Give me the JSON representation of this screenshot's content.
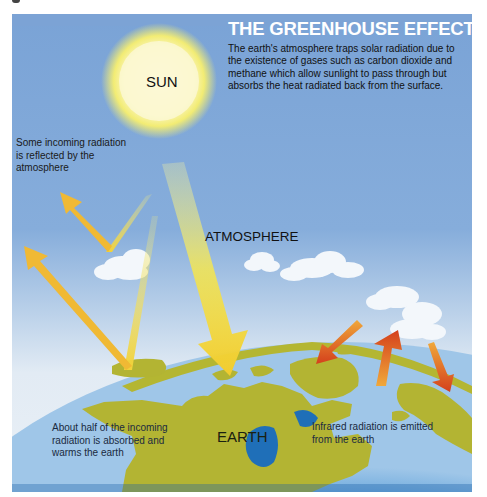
{
  "title": "THE GREENHOUSE EFFECT",
  "description": "The earth's atmosphere traps solar radiation due to the existence of gases such as carbon dioxide and methane which allow sunlight to pass through but absorbs the heat radiated back from the surface.",
  "labels": {
    "sun": "SUN",
    "atmosphere": "ATMOSPHERE",
    "earth": "EARTH",
    "reflected": "Some incoming radiation is reflected by the atmosphere",
    "absorbed": "About half of the incoming radiation is absorbed and warms the earth",
    "infrared": "Infrared radiation is emitted from the earth"
  },
  "colors": {
    "sky_top": "#7ea6d8",
    "sky_horizon": "#dfe9f3",
    "sun_core": "#fbf6c8",
    "sun_glow": "#f4ef7a",
    "incoming_arrow": "#f5d63a",
    "reflected_arrow": "#f0b830",
    "infrared_arrow": "#d8481e",
    "ocean": "#1f74c0",
    "land": "#b2b530",
    "cloud": "#f4f8fc"
  }
}
